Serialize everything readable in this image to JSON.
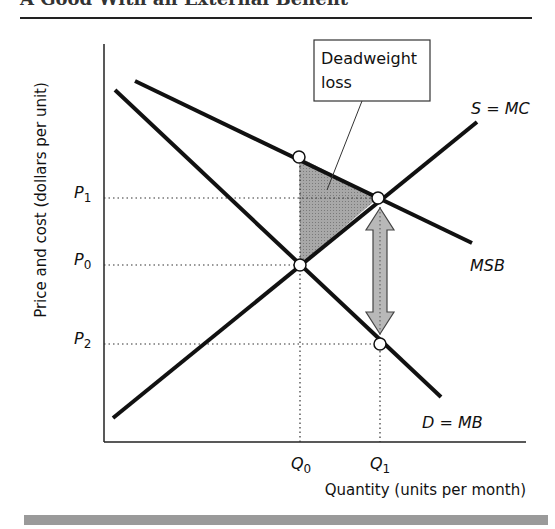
{
  "header": {
    "title": "A Good With an External Benefit"
  },
  "diagram": {
    "y_axis_label": "Price and cost (dollars per unit)",
    "x_axis_label": "Quantity (units per month)",
    "price_labels": {
      "p1_main": "P",
      "p1_sub": "1",
      "p0_main": "P",
      "p0_sub": "0",
      "p2_main": "P",
      "p2_sub": "2"
    },
    "quantity_labels": {
      "q0_main": "Q",
      "q0_sub": "0",
      "q1_main": "Q",
      "q1_sub": "1"
    },
    "curve_labels": {
      "supply": "S = MC",
      "social_benefit": "MSB",
      "demand": "D = MB"
    },
    "callout": {
      "line1": "Deadweight",
      "line2": "loss"
    },
    "colors": {
      "curve": "#111111",
      "deadweight_fill": "#9c9c9c",
      "arrow_fill": "#b8b8b8",
      "footer_bar": "#9a9a9a"
    }
  }
}
